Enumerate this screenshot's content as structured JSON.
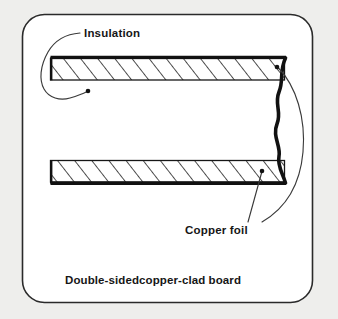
{
  "figure": {
    "background_color": "#eeeeec",
    "panel_color": "#ffffff",
    "ink_color": "#161616",
    "caption": "Double-sidedcopper-clad board",
    "callouts": [
      {
        "id": "insulation",
        "label": "Insulation",
        "points_to": "hatched-slab-interior"
      },
      {
        "id": "copper-foil",
        "label": "Copper foil",
        "points_to": "thick-outer-layer"
      }
    ],
    "parts": [
      {
        "name": "top-insulation-slab",
        "fill": "hatched",
        "hatch_direction": "forward-slash"
      },
      {
        "name": "top-copper-foil",
        "fill": "solid-black"
      },
      {
        "name": "bottom-insulation-slab",
        "fill": "hatched",
        "hatch_direction": "forward-slash"
      },
      {
        "name": "bottom-copper-foil",
        "fill": "solid-black"
      },
      {
        "name": "right-break-edge",
        "fill": "solid-black",
        "style": "wavy-break-line"
      }
    ]
  }
}
